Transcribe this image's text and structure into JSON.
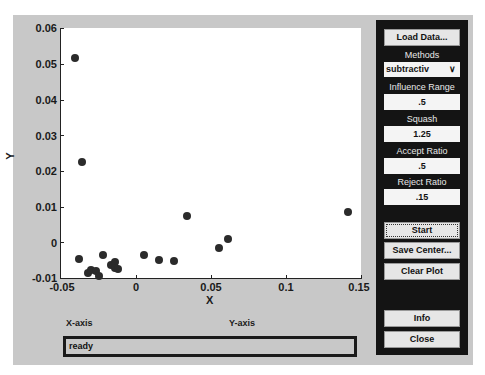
{
  "plot": {
    "xlabel": "X",
    "ylabel": "Y",
    "yticks": [
      "0.06",
      "0.05",
      "0.04",
      "0.03",
      "0.02",
      "0.01",
      "0",
      "-0.01"
    ],
    "xticks": [
      "-0.05",
      "0",
      "0.05",
      "0.1",
      "0.15"
    ]
  },
  "chart_data": {
    "type": "scatter",
    "title": "",
    "xlabel": "X",
    "ylabel": "Y",
    "xlim": [
      -0.05,
      0.15
    ],
    "ylim": [
      -0.01,
      0.06
    ],
    "grid": false,
    "x_ticks": [
      -0.05,
      0,
      0.05,
      0.1,
      0.15
    ],
    "y_ticks": [
      -0.01,
      0,
      0.01,
      0.02,
      0.03,
      0.04,
      0.05,
      0.06
    ],
    "series": [
      {
        "name": "data",
        "points": [
          {
            "x": -0.041,
            "y": 0.0516
          },
          {
            "x": -0.036,
            "y": 0.0225
          },
          {
            "x": -0.038,
            "y": -0.0047
          },
          {
            "x": -0.032,
            "y": -0.0085
          },
          {
            "x": -0.03,
            "y": -0.0077
          },
          {
            "x": -0.027,
            "y": -0.008
          },
          {
            "x": -0.025,
            "y": -0.0095
          },
          {
            "x": -0.022,
            "y": -0.0036
          },
          {
            "x": -0.017,
            "y": -0.0063
          },
          {
            "x": -0.014,
            "y": -0.0055
          },
          {
            "x": -0.014,
            "y": -0.0071
          },
          {
            "x": -0.012,
            "y": -0.0075
          },
          {
            "x": 0.005,
            "y": -0.0036
          },
          {
            "x": 0.015,
            "y": -0.0049
          },
          {
            "x": 0.025,
            "y": -0.0053
          },
          {
            "x": 0.034,
            "y": 0.0075
          },
          {
            "x": 0.055,
            "y": -0.0016
          },
          {
            "x": 0.061,
            "y": 0.001
          },
          {
            "x": 0.141,
            "y": 0.0085
          }
        ]
      }
    ]
  },
  "labels": {
    "x_axis": "X-axis",
    "y_axis": "Y-axis"
  },
  "status": {
    "text": "ready"
  },
  "panel": {
    "load_data": "Load Data...",
    "methods_label": "Methods",
    "methods_value": "subtractiv",
    "chevron": "∨",
    "influence_label": "Influence Range",
    "influence_value": ".5",
    "squash_label": "Squash",
    "squash_value": "1.25",
    "accept_label": "Accept Ratio",
    "accept_value": ".5",
    "reject_label": "Reject Ratio",
    "reject_value": ".15",
    "start": "Start",
    "save_center": "Save Center...",
    "clear_plot": "Clear Plot",
    "info": "Info",
    "close": "Close"
  }
}
